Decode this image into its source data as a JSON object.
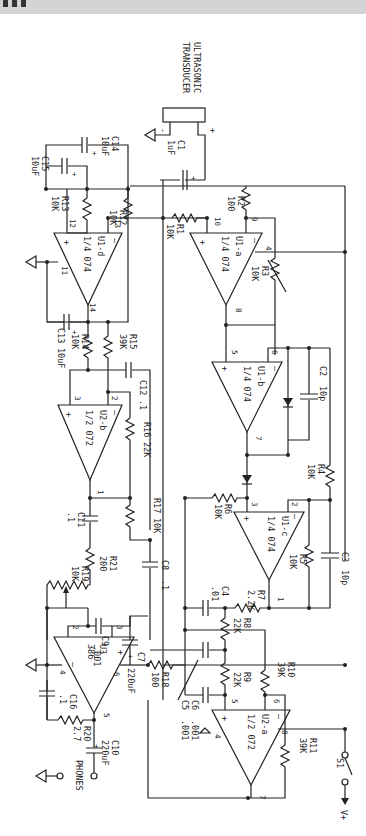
{
  "transducer": {
    "line1": "ULTRASONIC",
    "line2": "TRANSDUCER",
    "minus": "-",
    "plus": "+"
  },
  "components": {
    "C1": {
      "ref": "C1",
      "value": "1uF"
    },
    "C2": {
      "ref": "C2",
      "value": "10p"
    },
    "C3": {
      "ref": "C3",
      "value": "10p"
    },
    "C4": {
      "ref": "C4",
      "value": ".01"
    },
    "C5": {
      "ref": "C5",
      "value": ".001"
    },
    "C6": {
      "ref": "C6",
      "value": ".001"
    },
    "C7": {
      "ref": "C7",
      "value": "220uF"
    },
    "C8": {
      "ref": "C8",
      "value": ".1"
    },
    "C9": {
      "ref": "C9",
      "value": ".001"
    },
    "C10": {
      "ref": "C10",
      "value": "220uF"
    },
    "C11": {
      "ref": "C11",
      "value": ".1"
    },
    "C12": {
      "ref": "C12",
      "value": ".1"
    },
    "C13": {
      "ref": "C13",
      "value": "10uF"
    },
    "C14": {
      "ref": "C14",
      "value": "10uF"
    },
    "C15": {
      "ref": "C15",
      "value": "10uF"
    },
    "C16": {
      "ref": "C16",
      "value": ".1"
    },
    "R1": {
      "ref": "R1",
      "value": "10K"
    },
    "R2": {
      "ref": "R2",
      "value": "100"
    },
    "R3": {
      "ref": "R3",
      "value": "10K"
    },
    "R4": {
      "ref": "R4",
      "value": "10K"
    },
    "R5": {
      "ref": "R5",
      "value": "10K"
    },
    "R6": {
      "ref": "R6",
      "value": "10K"
    },
    "R7": {
      "ref": "R7",
      "value": "2.2K"
    },
    "R8": {
      "ref": "R8",
      "value": "22K"
    },
    "R9": {
      "ref": "R9",
      "value": "22K"
    },
    "R10": {
      "ref": "R10",
      "value": "39K"
    },
    "R11": {
      "ref": "R11",
      "value": "39K"
    },
    "R12": {
      "ref": "R12",
      "value": "10K"
    },
    "R13": {
      "ref": "R13",
      "value": "10K"
    },
    "R14": {
      "ref": "R14",
      "value": "10K"
    },
    "R15": {
      "ref": "R15",
      "value": "39K"
    },
    "R16": {
      "ref": "R16",
      "value": "22K"
    },
    "R17": {
      "ref": "R17",
      "value": "10K"
    },
    "R18": {
      "ref": "R18",
      "value": "100"
    },
    "R19": {
      "ref": "R19",
      "value": "10K"
    },
    "R20": {
      "ref": "R20",
      "value": "2.7"
    },
    "R21": {
      "ref": "R21",
      "value": "200"
    }
  },
  "opamps": {
    "U1a": {
      "ref": "U1-a",
      "part": "1/4 074",
      "pins": [
        "10",
        "9",
        "8",
        "4"
      ]
    },
    "U1b": {
      "ref": "U1-b",
      "part": "1/4 074",
      "pins": [
        "5",
        "6",
        "7"
      ]
    },
    "U1c": {
      "ref": "U1-c",
      "part": "1/4 074",
      "pins": [
        "3",
        "2",
        "1"
      ]
    },
    "U1d": {
      "ref": "U1-d",
      "part": "1/4 074",
      "pins": [
        "12",
        "13",
        "14",
        "11"
      ]
    },
    "U2a": {
      "ref": "U2-a",
      "part": "1/2 072",
      "pins": [
        "5",
        "6",
        "7",
        "8",
        "4"
      ]
    },
    "U2b": {
      "ref": "U2-b",
      "part": "1/2 072",
      "pins": [
        "3",
        "2",
        "1"
      ]
    },
    "U3": {
      "ref": "U3",
      "part": "386",
      "pins": [
        "3",
        "2",
        "6",
        "4",
        "5"
      ]
    }
  },
  "switch": {
    "ref": "S1",
    "supply": "V+"
  },
  "output": {
    "label": "PHONES"
  },
  "signs": {
    "plus": "+",
    "minus": "—"
  }
}
